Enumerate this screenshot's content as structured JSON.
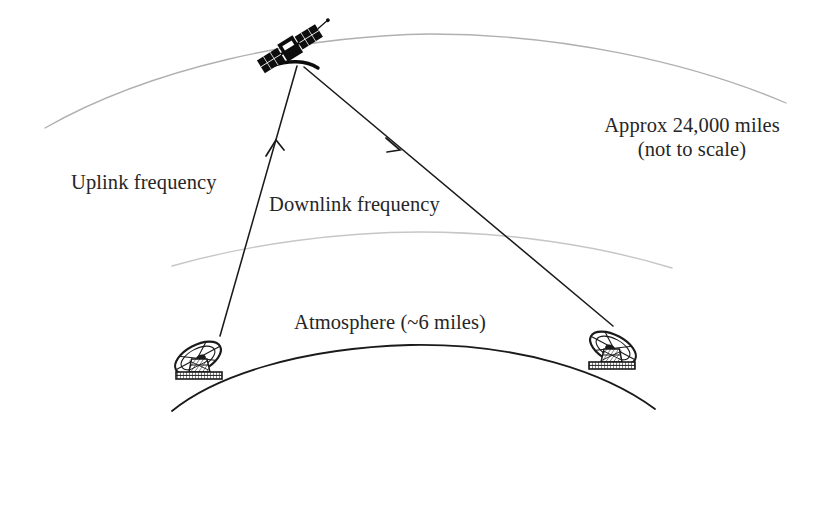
{
  "diagram": {
    "labels": {
      "uplink": "Uplink frequency",
      "downlink": "Downlink frequency",
      "atmosphere": "Atmosphere (~6 miles)",
      "distance_line1": "Approx 24,000 miles",
      "distance_line2": "(not to scale)"
    },
    "icons": {
      "satellite": "satellite-icon",
      "ground_station_left": "satellite-dish-icon",
      "ground_station_right": "satellite-dish-icon",
      "uplink_arrow": "arrow-up-icon",
      "downlink_arrow": "arrow-down-right-icon"
    },
    "colors": {
      "background": "#ffffff",
      "text": "#262626",
      "orbit_arc": "#b4b4b4",
      "atmosphere_arc": "#c8c8c8",
      "earth_arc": "#1a1a1a",
      "signal_line": "#1a1a1a",
      "satellite_body": "#0d0d0d"
    },
    "elements": {
      "orbit_arc_label": "geostationary orbit arc",
      "atmosphere_arc_label": "atmosphere boundary arc",
      "earth_arc_label": "earth surface arc",
      "uplink_path_label": "uplink signal path",
      "downlink_path_label": "downlink signal path"
    }
  }
}
